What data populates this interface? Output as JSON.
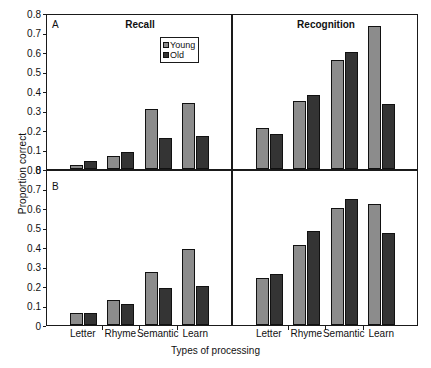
{
  "figure": {
    "ylabel": "Proportion correct",
    "xlabel": "Types of processing",
    "panel_a_letter": "A",
    "panel_b_letter": "B",
    "title_recall": "Recall",
    "title_recognition": "Recognition"
  },
  "legend": {
    "young_label": "Young",
    "old_label": "Old",
    "young_color": "#8c8c8c",
    "old_color": "#343434"
  },
  "yaxis": {
    "ticks": [
      "0.8",
      "0.7",
      "0.6",
      "0.5",
      "0.4",
      "0.3",
      "0.2",
      "0.1",
      "0"
    ],
    "min": 0,
    "max": 0.8
  },
  "chart_data": [
    {
      "type": "bar",
      "panel": "A",
      "title": "Recall",
      "categories": [
        "Case",
        "Rhyme",
        "Category",
        "Learn"
      ],
      "series": [
        {
          "name": "Young",
          "values": [
            0.02,
            0.065,
            0.31,
            0.34
          ],
          "color": "#8c8c8c"
        },
        {
          "name": "Old",
          "values": [
            0.04,
            0.085,
            0.16,
            0.17
          ],
          "color": "#343434"
        }
      ],
      "xlabel": "Types of processing",
      "ylabel": "Proportion correct",
      "ylim": [
        0,
        0.8
      ],
      "grid": false,
      "legend_position": "upper-right-inside"
    },
    {
      "type": "bar",
      "panel": "A",
      "title": "Recognition",
      "categories": [
        "Case",
        "Rhyme",
        "Category",
        "Learn"
      ],
      "series": [
        {
          "name": "Young",
          "values": [
            0.21,
            0.35,
            0.56,
            0.735
          ],
          "color": "#8c8c8c"
        },
        {
          "name": "Old",
          "values": [
            0.18,
            0.38,
            0.6,
            0.335
          ],
          "color": "#343434"
        }
      ],
      "xlabel": "Types of processing",
      "ylabel": "Proportion correct",
      "ylim": [
        0,
        0.8
      ],
      "grid": false,
      "legend_position": "none"
    },
    {
      "type": "bar",
      "panel": "B",
      "title": "",
      "categories": [
        "Letter",
        "Rhyme",
        "Semantic",
        "Learn"
      ],
      "series": [
        {
          "name": "Young",
          "values": [
            0.06,
            0.13,
            0.27,
            0.39
          ],
          "color": "#8c8c8c"
        },
        {
          "name": "Old",
          "values": [
            0.06,
            0.11,
            0.19,
            0.2
          ],
          "color": "#343434"
        }
      ],
      "xlabel": "Types of processing",
      "ylabel": "Proportion correct",
      "ylim": [
        0,
        0.8
      ],
      "grid": false,
      "legend_position": "none"
    },
    {
      "type": "bar",
      "panel": "B",
      "title": "",
      "categories": [
        "Letter",
        "Rhyme",
        "Semantic",
        "Learn"
      ],
      "series": [
        {
          "name": "Young",
          "values": [
            0.24,
            0.41,
            0.6,
            0.62
          ],
          "color": "#8c8c8c"
        },
        {
          "name": "Old",
          "values": [
            0.26,
            0.48,
            0.645,
            0.47
          ],
          "color": "#343434"
        }
      ],
      "xlabel": "Types of processing",
      "ylabel": "Proportion correct",
      "ylim": [
        0,
        0.8
      ],
      "grid": false,
      "legend_position": "none"
    }
  ]
}
